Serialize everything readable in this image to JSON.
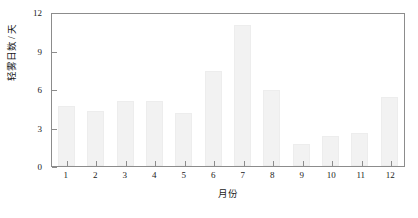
{
  "chart_data": {
    "type": "bar",
    "title": "",
    "subtitle": "",
    "xlabel": "月份",
    "ylabel": "轻雾日数 / 天",
    "categories": [
      "1",
      "2",
      "3",
      "4",
      "5",
      "6",
      "7",
      "8",
      "9",
      "10",
      "11",
      "12"
    ],
    "values": [
      4.7,
      4.3,
      5.1,
      5.1,
      4.1,
      7.4,
      11.0,
      5.9,
      1.7,
      2.3,
      2.6,
      5.4
    ],
    "ylim": [
      0,
      12
    ],
    "y_ticks": [
      0,
      3,
      6,
      9,
      12
    ],
    "y_tick_labels": [
      "0",
      "3",
      "6",
      "9",
      "12"
    ],
    "grid": false,
    "legend": null,
    "legend_position": "none",
    "bar_color": "#f2f2f2",
    "bar_edge_color": "#ededed",
    "axis_color": "#8c8c8c",
    "text_color": "#1a1a1a"
  }
}
